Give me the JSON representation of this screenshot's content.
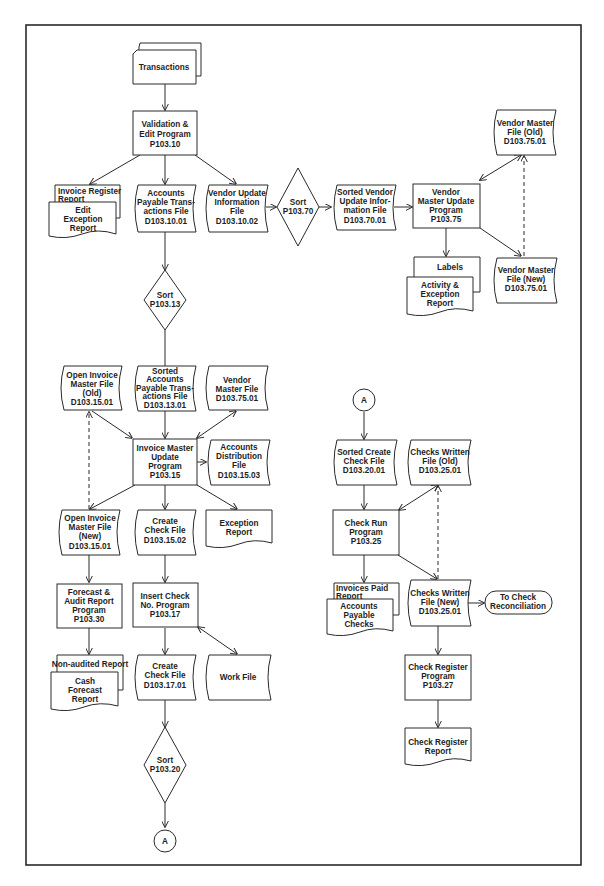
{
  "diagram": {
    "type": "system flowchart",
    "colors": {
      "line": "#2a2a2a",
      "text": "#1e1e1e",
      "background": "#ffffff"
    }
  },
  "nodes": {
    "transactions": {
      "shape": "punched-card-deck",
      "lines": [
        "Transactions"
      ]
    },
    "validation_program": {
      "shape": "process",
      "lines": [
        "Validation &",
        "Edit Program",
        "P103.10"
      ]
    },
    "invoice_register_report": {
      "shape": "document",
      "lines": [
        "Invoice Register",
        "Report"
      ]
    },
    "edit_exception_report": {
      "shape": "document",
      "lines": [
        "Edit",
        "Exception",
        "Report"
      ]
    },
    "ap_transactions_file": {
      "shape": "file",
      "lines": [
        "Accounts",
        "Payable Trans-",
        "actions File",
        "D103.10.01"
      ]
    },
    "vendor_update_info_file": {
      "shape": "file",
      "lines": [
        "Vendor Update",
        "Information",
        "File",
        "D103.10.02"
      ]
    },
    "sort_p10370": {
      "shape": "sort",
      "lines": [
        "Sort",
        "P103.70"
      ]
    },
    "sorted_vendor_update_file": {
      "shape": "file",
      "lines": [
        "Sorted Vendor",
        "Update Infor-",
        "mation File",
        "D103.70.01"
      ]
    },
    "vendor_master_update_program": {
      "shape": "process",
      "lines": [
        "Vendor",
        "Master Update",
        "Program",
        "P103.75"
      ]
    },
    "vendor_master_file_old": {
      "shape": "file",
      "lines": [
        "Vendor Master",
        "File (Old)",
        "D103.75.01"
      ]
    },
    "labels": {
      "shape": "document",
      "lines": [
        "Labels"
      ]
    },
    "activity_exception_report": {
      "shape": "document",
      "lines": [
        "Activity &",
        "Exception",
        "Report"
      ]
    },
    "vendor_master_file_new": {
      "shape": "file",
      "lines": [
        "Vendor Master",
        "File (New)",
        "D103.75.01"
      ]
    },
    "sort_p10313": {
      "shape": "sort",
      "lines": [
        "Sort",
        "P103.13"
      ]
    },
    "open_invoice_master_old": {
      "shape": "file",
      "lines": [
        "Open Invoice",
        "Master File",
        "(Old)",
        "D103.15.01"
      ]
    },
    "sorted_ap_transactions_file": {
      "shape": "file",
      "lines": [
        "Sorted",
        "Accounts",
        "Payable Trans-",
        "actions File",
        "D103.13.01"
      ]
    },
    "vendor_master_file": {
      "shape": "file",
      "lines": [
        "Vendor",
        "Master File",
        "D103.75.01"
      ]
    },
    "invoice_master_update_program": {
      "shape": "process",
      "lines": [
        "Invoice Master",
        "Update",
        "Program",
        "P103.15"
      ]
    },
    "accounts_distribution_file": {
      "shape": "file",
      "lines": [
        "Accounts",
        "Distribution",
        "File",
        "D103.15.03"
      ]
    },
    "open_invoice_master_new": {
      "shape": "file",
      "lines": [
        "Open Invoice",
        "Master File",
        "(New)",
        "D103.15.01"
      ]
    },
    "create_check_file_1": {
      "shape": "file",
      "lines": [
        "Create",
        "Check File",
        "D103.15.02"
      ]
    },
    "exception_report": {
      "shape": "document",
      "lines": [
        "Exception",
        "Report"
      ]
    },
    "forecast_audit_program": {
      "shape": "process",
      "lines": [
        "Forecast &",
        "Audit Report",
        "Program",
        "P103.30"
      ]
    },
    "insert_check_program": {
      "shape": "process",
      "lines": [
        "Insert Check",
        "No. Program",
        "P103.17"
      ]
    },
    "non_audited_report": {
      "shape": "document",
      "lines": [
        "Non-audited Report"
      ]
    },
    "cash_forecast_report": {
      "shape": "document",
      "lines": [
        "Cash",
        "Forecast",
        "Report"
      ]
    },
    "create_check_file_2": {
      "shape": "file",
      "lines": [
        "Create",
        "Check File",
        "D103.17.01"
      ]
    },
    "work_file": {
      "shape": "file",
      "lines": [
        "Work File"
      ]
    },
    "sort_p10320": {
      "shape": "sort",
      "lines": [
        "Sort",
        "P103.20"
      ]
    },
    "connector_a_out": {
      "shape": "connector",
      "lines": [
        "A"
      ]
    },
    "connector_a_in": {
      "shape": "connector",
      "lines": [
        "A"
      ]
    },
    "sorted_create_check_file": {
      "shape": "file",
      "lines": [
        "Sorted Create",
        "Check File",
        "D103.20.01"
      ]
    },
    "checks_written_old": {
      "shape": "file",
      "lines": [
        "Checks Written",
        "File (Old)",
        "D103.25.01"
      ]
    },
    "check_run_program": {
      "shape": "process",
      "lines": [
        "Check Run",
        "Program",
        "P103.25"
      ]
    },
    "invoices_paid_report": {
      "shape": "document",
      "lines": [
        "Invoices Paid",
        "Report"
      ]
    },
    "ap_checks": {
      "shape": "document",
      "lines": [
        "Accounts",
        "Payable",
        "Checks"
      ]
    },
    "checks_written_new": {
      "shape": "file",
      "lines": [
        "Checks Written",
        "File (New)",
        "D103.25.01"
      ]
    },
    "to_check_reconciliation": {
      "shape": "terminal",
      "lines": [
        "To Check",
        "Reconciliation"
      ]
    },
    "check_register_program": {
      "shape": "process",
      "lines": [
        "Check Register",
        "Program",
        "P103.27"
      ]
    },
    "check_register_report": {
      "shape": "document",
      "lines": [
        "Check Register",
        "Report"
      ]
    }
  }
}
